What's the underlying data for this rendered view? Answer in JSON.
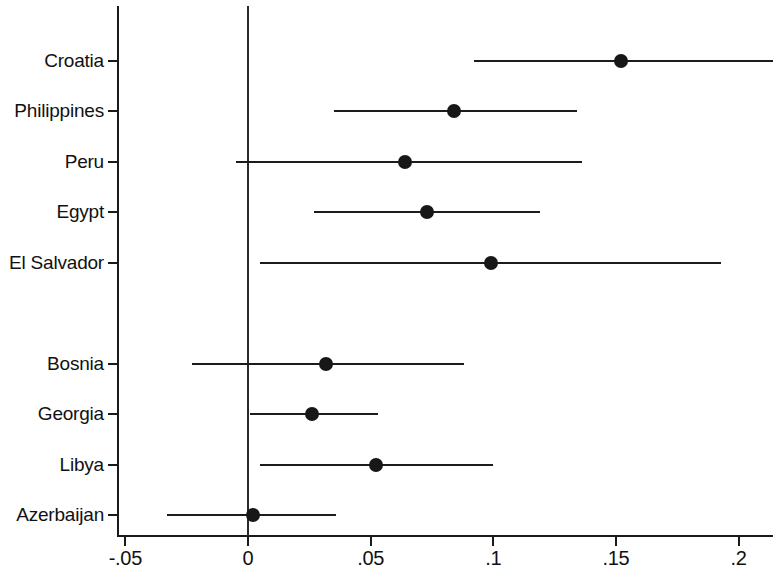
{
  "chart_data": {
    "type": "scatter",
    "subtype": "forest-plot",
    "title": "",
    "xlabel": "",
    "ylabel": "",
    "xlim": [
      -0.062,
      0.2135
    ],
    "xticks": [
      -0.05,
      0,
      0.05,
      0.1,
      0.15,
      0.2
    ],
    "xticklabels": [
      "-.05",
      "0",
      ".05",
      ".1",
      ".15",
      ".2"
    ],
    "grid": false,
    "legend": null,
    "reference_line": 0,
    "categories": [
      "Croatia",
      "Philippines",
      "Peru",
      "Egypt",
      "El Salvador",
      "",
      "Bosnia",
      "Georgia",
      "Libya",
      "Azerbaijan"
    ],
    "points": [
      {
        "label": "Croatia",
        "estimate": 0.152,
        "ci_low": 0.092,
        "ci_high": 0.214
      },
      {
        "label": "Philippines",
        "estimate": 0.084,
        "ci_low": 0.035,
        "ci_high": 0.134
      },
      {
        "label": "Peru",
        "estimate": 0.064,
        "ci_low": -0.005,
        "ci_high": 0.136
      },
      {
        "label": "Egypt",
        "estimate": 0.073,
        "ci_low": 0.027,
        "ci_high": 0.119
      },
      {
        "label": "El Salvador",
        "estimate": 0.099,
        "ci_low": 0.005,
        "ci_high": 0.193
      },
      {
        "label": "Bosnia",
        "estimate": 0.032,
        "ci_low": -0.023,
        "ci_high": 0.088
      },
      {
        "label": "Georgia",
        "estimate": 0.026,
        "ci_low": 0.001,
        "ci_high": 0.053
      },
      {
        "label": "Libya",
        "estimate": 0.052,
        "ci_low": 0.005,
        "ci_high": 0.1
      },
      {
        "label": "Azerbaijan",
        "estimate": 0.002,
        "ci_low": -0.033,
        "ci_high": 0.036
      }
    ],
    "colors": {
      "marker": "#171717",
      "ci": "#1c1c1c",
      "axis": "#1a1a1a",
      "reference": "#2b2b2b",
      "background": "#ffffff"
    }
  },
  "axis": {
    "x_tick_labels": [
      "-.05",
      "0",
      ".05",
      ".1",
      ".15",
      ".2"
    ],
    "y_tick_labels": [
      "Croatia",
      "Philippines",
      "Peru",
      "Egypt",
      "El Salvador",
      "Bosnia",
      "Georgia",
      "Libya",
      "Azerbaijan"
    ]
  }
}
